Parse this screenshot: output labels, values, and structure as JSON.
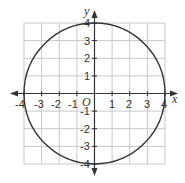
{
  "figure": {
    "type": "coordinate-plane-graph"
  },
  "axes": {
    "x_label": "x",
    "y_label": "y",
    "origin_label": "O",
    "x_ticks": [
      "-4",
      "-3",
      "-2",
      "-1",
      "1",
      "2",
      "3",
      "4"
    ],
    "y_ticks": [
      "4",
      "3",
      "2",
      "1",
      "-1",
      "-2",
      "-3",
      "-4"
    ],
    "x_range": [
      -4,
      4
    ],
    "y_range": [
      -4,
      4
    ]
  },
  "curve": {
    "shape": "circle",
    "center": [
      0,
      0
    ],
    "radius": 4
  },
  "colors": {
    "grid": "#c8c8c8",
    "axis": "#333333",
    "curve": "#333333",
    "text": "#333333"
  }
}
